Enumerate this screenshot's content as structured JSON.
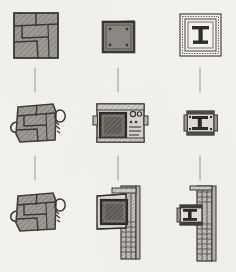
{
  "sheet": {
    "title": "Hand-drawn design progression sketch sheet",
    "medium": "pencil on paper",
    "background_color": "#f3f1ed",
    "ink_color": "#4a4744",
    "fill_color": "#9b9792",
    "dark_fill_color": "#5a5752",
    "connector_color": "#9d9a95",
    "rows": 3,
    "columns": 3
  },
  "grid": {
    "columns": [
      {
        "id": "column-1",
        "name": "quad-block-column",
        "label": "",
        "steps": [
          {
            "id": "r1c1",
            "name": "quad-block-plain",
            "label": "",
            "caption": ""
          },
          {
            "id": "r2c1",
            "name": "quad-block-with-handles",
            "label": "",
            "caption": ""
          },
          {
            "id": "r3c1",
            "name": "quad-block-with-handles-final",
            "label": "",
            "caption": ""
          }
        ]
      },
      {
        "id": "column-2",
        "name": "dark-square-column",
        "label": "",
        "steps": [
          {
            "id": "r1c2",
            "name": "dark-square-plain",
            "label": "",
            "caption": ""
          },
          {
            "id": "r2c2",
            "name": "dark-square-in-housing",
            "label": "",
            "caption": ""
          },
          {
            "id": "r3c2",
            "name": "dark-square-mounted-on-rail",
            "label": "",
            "caption": ""
          }
        ]
      },
      {
        "id": "column-3",
        "name": "ibeam-column",
        "label": "",
        "steps": [
          {
            "id": "r1c3",
            "name": "ibeam-in-dotted-frame",
            "label": "",
            "caption": ""
          },
          {
            "id": "r2c3",
            "name": "ibeam-with-brackets",
            "label": "",
            "caption": ""
          },
          {
            "id": "r3c3",
            "name": "ibeam-mounted-on-rail",
            "label": "",
            "caption": ""
          }
        ]
      }
    ],
    "connectors": [
      {
        "id": "conn-c1-a",
        "name": "connector-col1-row1-row2"
      },
      {
        "id": "conn-c1-b",
        "name": "connector-col1-row2-row3"
      },
      {
        "id": "conn-c2-a",
        "name": "connector-col2-row1-row2"
      },
      {
        "id": "conn-c2-b",
        "name": "connector-col2-row2-row3"
      },
      {
        "id": "conn-c3-a",
        "name": "connector-col3-row1-row2"
      },
      {
        "id": "conn-c3-b",
        "name": "connector-col3-row2-row3"
      }
    ]
  }
}
